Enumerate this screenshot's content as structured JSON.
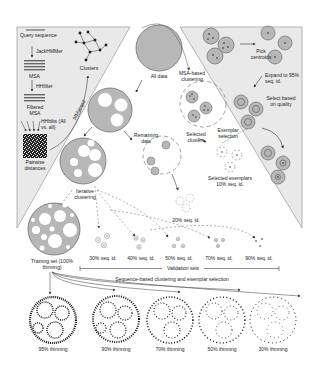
{
  "figure": {
    "top_fragment": "",
    "colors": {
      "panel_fill": "#e9e9e9",
      "circle_fill": "#b7b7b7",
      "circle_stroke": "#6f6f6f",
      "dashed": "#7a7a7a",
      "text": "#222222"
    },
    "left_panel": {
      "query_sequence": "Query sequence",
      "jackhmmer": "JackHMMer",
      "msa": "MSA",
      "hhfilter": "HHfilter",
      "filtered_msa": "Filtered MSA",
      "hhblits": "HHblits (All vs. all)",
      "pairwise_distances": "Pairwise distances",
      "clusters": "Clusters",
      "mmseqs2": "MMseqs2"
    },
    "center": {
      "all_data": "All data",
      "msa_based_clustering": "MSA-based clustering",
      "remaining_data": "Remaining data",
      "selected_clusters": "Selected clusters",
      "exemplar_selection": "Exemplar selection",
      "selected_exemplars": "Selected exemplars 10% seq. id.",
      "seq_20": "20% seq. id.",
      "iterative_clustering": "Iterative clustering",
      "training_set": "Training set (100% thinning)"
    },
    "right_panel": {
      "pick_centroids": "Pick centroids",
      "expand": "Expand to 95% seq. id.",
      "select_quality": "Select based on quality"
    },
    "validation": {
      "label": "Validation sets",
      "sets": [
        "30% seq. id.",
        "40% seq. id.",
        "50% seq. id.",
        "70% seq. id.",
        "90% seq. id."
      ]
    },
    "bottom": {
      "caption": "Sequence-based clustering and exemplar selection",
      "thinning": [
        "95% thinning",
        "90% thinning",
        "70% thinning",
        "50% thinning",
        "30% thinning"
      ]
    }
  }
}
